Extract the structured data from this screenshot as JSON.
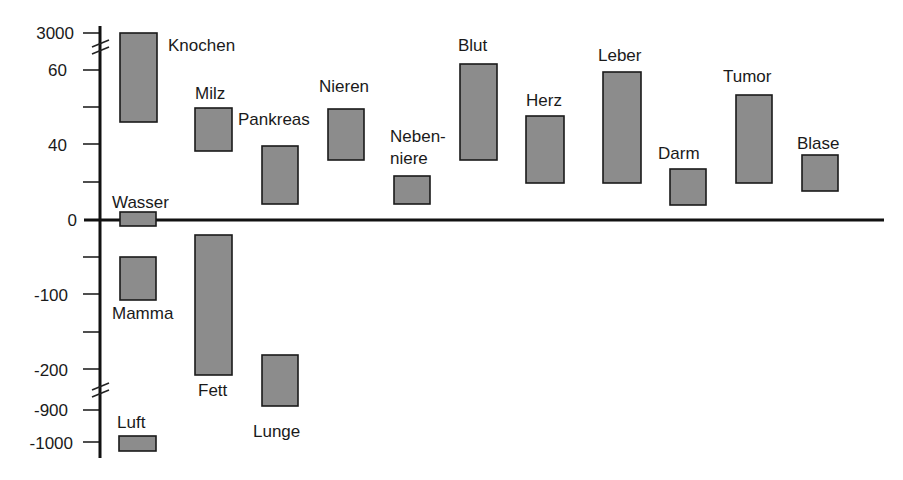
{
  "chart_data": {
    "type": "bar",
    "subtype": "floating-range",
    "title": "",
    "xlabel": "",
    "ylabel": "",
    "y_axis": {
      "scale": "piecewise with breaks",
      "tick_labels": [
        "3000",
        "60",
        "40",
        "0",
        "-100",
        "-200",
        "-900",
        "-1000"
      ],
      "ticks": [
        3000,
        60,
        50,
        40,
        20,
        0,
        -50,
        -100,
        -150,
        -200,
        -900,
        -1000
      ],
      "breaks": [
        [
          60,
          3000
        ],
        [
          -900,
          -200
        ]
      ]
    },
    "grid": false,
    "legend": null,
    "categories": [
      "Knochen",
      "Milz",
      "Pankreas",
      "Nieren",
      "Nebenniere",
      "Blut",
      "Herz",
      "Leber",
      "Darm",
      "Tumor",
      "Blase",
      "Wasser",
      "Mamma",
      "Fett",
      "Lunge",
      "Luft"
    ],
    "series": [
      {
        "name": "range",
        "values": [
          {
            "label": "Knochen",
            "low": 46,
            "high": 3000
          },
          {
            "label": "Milz",
            "low": 38,
            "high": 50
          },
          {
            "label": "Pankreas",
            "low": 8,
            "high": 40
          },
          {
            "label": "Nieren",
            "low": 31,
            "high": 50
          },
          {
            "label": "Nebenniere",
            "low": 8,
            "high": 23
          },
          {
            "label": "Blut",
            "low": 31,
            "high": 62
          },
          {
            "label": "Herz",
            "low": 19,
            "high": 48
          },
          {
            "label": "Leber",
            "low": 19,
            "high": 60
          },
          {
            "label": "Darm",
            "low": 7,
            "high": 27
          },
          {
            "label": "Tumor",
            "low": 19,
            "high": 53
          },
          {
            "label": "Blase",
            "low": 15,
            "high": 34
          },
          {
            "label": "Wasser",
            "low": -5,
            "high": 4
          },
          {
            "label": "Mamma",
            "low": -108,
            "high": -51
          },
          {
            "label": "Fett",
            "low": -209,
            "high": -21
          },
          {
            "label": "Lunge",
            "low": -880,
            "high": -180
          },
          {
            "label": "Luft",
            "low": -1040,
            "high": -990
          }
        ]
      }
    ]
  },
  "axis_labels": {
    "t3000": "3000",
    "t60": "60",
    "t40": "40",
    "t0": "0",
    "tm100": "-100",
    "tm200": "-200",
    "tm900": "-900",
    "tm1000": "-1000"
  },
  "bars": [
    {
      "label": "Knochen",
      "x": 120,
      "y": 33,
      "w": 37,
      "h": 89,
      "lx": 168,
      "ly": 51,
      "label2": ""
    },
    {
      "label": "Milz",
      "x": 195,
      "y": 108,
      "w": 37,
      "h": 43,
      "lx": 195,
      "ly": 99,
      "label2": ""
    },
    {
      "label": "Pankreas",
      "x": 262,
      "y": 146,
      "w": 36,
      "h": 58,
      "lx": 238,
      "ly": 125,
      "label2": ""
    },
    {
      "label": "Nieren",
      "x": 328,
      "y": 109,
      "w": 36,
      "h": 51,
      "lx": 319,
      "ly": 92,
      "label2": ""
    },
    {
      "label": "Neben-",
      "x": 394,
      "y": 176,
      "w": 36,
      "h": 28,
      "lx": 390,
      "ly": 142,
      "label2": "niere"
    },
    {
      "label": "Blut",
      "x": 460,
      "y": 64,
      "w": 37,
      "h": 96,
      "lx": 458,
      "ly": 51,
      "label2": ""
    },
    {
      "label": "Herz",
      "x": 526,
      "y": 116,
      "w": 38,
      "h": 67,
      "lx": 526,
      "ly": 106,
      "label2": ""
    },
    {
      "label": "Leber",
      "x": 603,
      "y": 72,
      "w": 38,
      "h": 111,
      "lx": 598,
      "ly": 61,
      "label2": ""
    },
    {
      "label": "Darm",
      "x": 670,
      "y": 169,
      "w": 36,
      "h": 36,
      "lx": 658,
      "ly": 159,
      "label2": ""
    },
    {
      "label": "Tumor",
      "x": 736,
      "y": 95,
      "w": 36,
      "h": 88,
      "lx": 723,
      "ly": 82,
      "label2": ""
    },
    {
      "label": "Blase",
      "x": 802,
      "y": 155,
      "w": 36,
      "h": 36,
      "lx": 797,
      "ly": 149,
      "label2": ""
    },
    {
      "label": "Wasser",
      "x": 120,
      "y": 212,
      "w": 36,
      "h": 14,
      "lx": 112,
      "ly": 208,
      "label2": ""
    },
    {
      "label": "Mamma",
      "x": 120,
      "y": 257,
      "w": 36,
      "h": 43,
      "lx": 112,
      "ly": 319,
      "label2": ""
    },
    {
      "label": "Fett",
      "x": 195,
      "y": 235,
      "w": 37,
      "h": 140,
      "lx": 198,
      "ly": 396,
      "label2": ""
    },
    {
      "label": "Lunge",
      "x": 262,
      "y": 355,
      "w": 36,
      "h": 51,
      "lx": 253,
      "ly": 437,
      "label2": ""
    },
    {
      "label": "Luft",
      "x": 119,
      "y": 436,
      "w": 37,
      "h": 15,
      "lx": 117,
      "ly": 428,
      "label2": ""
    }
  ]
}
